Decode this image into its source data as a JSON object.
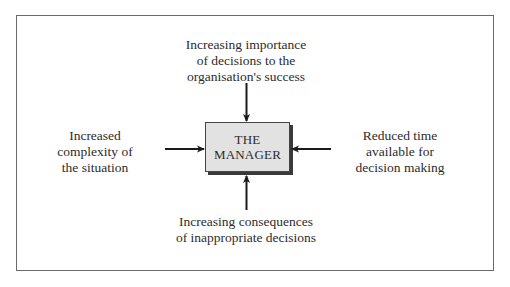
{
  "diagram": {
    "center": {
      "line1": "THE",
      "line2": "MANAGER"
    },
    "factors": {
      "top": "Increasing importance\nof decisions to the\norganisation's success",
      "left": "Increased\ncomplexity of\nthe situation",
      "right": "Reduced time\navailable for\ndecision making",
      "bottom": "Increasing consequences\nof inappropriate decisions"
    },
    "colors": {
      "box_fill": "#e2e2e2",
      "box_shadow": "#3a3a3a",
      "arrow": "#1a1a1a",
      "frame": "#6a6a6a"
    }
  }
}
